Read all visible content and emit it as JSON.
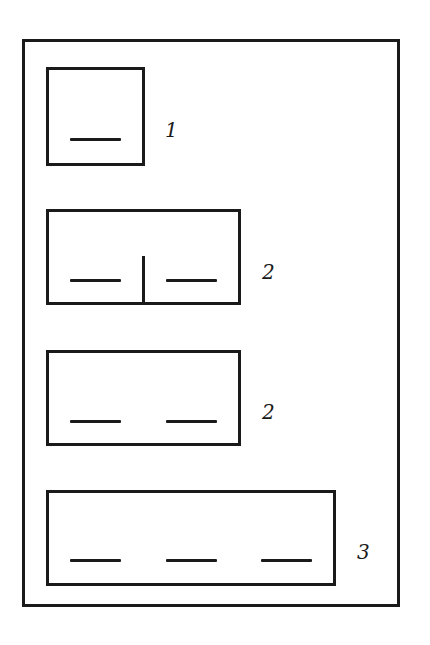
{
  "diagram": {
    "boxes": [
      {
        "label": "1",
        "blanks": 1,
        "divided": false
      },
      {
        "label": "2",
        "blanks": 2,
        "divided": true
      },
      {
        "label": "2",
        "blanks": 2,
        "divided": false
      },
      {
        "label": "3",
        "blanks": 3,
        "divided": false
      }
    ]
  }
}
